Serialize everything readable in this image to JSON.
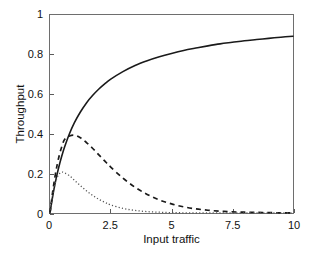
{
  "chart_data": {
    "type": "line",
    "title": "",
    "xlabel": "Input traffic",
    "ylabel": "Throughput",
    "xlim": [
      0,
      10
    ],
    "ylim": [
      0,
      1
    ],
    "grid": false,
    "legend": "none",
    "xticks": [
      "0",
      "2.5",
      "5",
      "7.5",
      "10"
    ],
    "xtick_values": [
      0,
      2.5,
      5,
      7.5,
      10
    ],
    "yticks": [
      "0",
      "0.2",
      "0.4",
      "0.6",
      "0.8",
      "1"
    ],
    "ytick_values": [
      0,
      0.2,
      0.4,
      0.6,
      0.8,
      1
    ],
    "x": [
      0,
      0.1,
      0.2,
      0.3,
      0.4,
      0.5,
      0.6,
      0.8,
      1.0,
      1.25,
      1.5,
      1.75,
      2.0,
      2.25,
      2.5,
      3.0,
      3.5,
      4.0,
      4.5,
      5.0,
      5.5,
      6.0,
      6.5,
      7.0,
      7.5,
      8.0,
      8.5,
      9.0,
      9.5,
      10.0
    ],
    "series": [
      {
        "name": "throughput-solid",
        "style": "solid",
        "color": "#1a1a1a",
        "values": [
          0.0,
          0.077,
          0.143,
          0.2,
          0.25,
          0.294,
          0.333,
          0.4,
          0.455,
          0.51,
          0.556,
          0.593,
          0.625,
          0.652,
          0.676,
          0.714,
          0.745,
          0.769,
          0.789,
          0.806,
          0.821,
          0.833,
          0.844,
          0.854,
          0.862,
          0.87,
          0.876,
          0.882,
          0.888,
          0.893
        ]
      },
      {
        "name": "throughput-dashed",
        "style": "dashed",
        "color": "#1a1a1a",
        "values": [
          0.0,
          0.098,
          0.18,
          0.247,
          0.3,
          0.341,
          0.371,
          0.389,
          0.393,
          0.38,
          0.356,
          0.327,
          0.295,
          0.263,
          0.232,
          0.176,
          0.13,
          0.094,
          0.066,
          0.046,
          0.031,
          0.021,
          0.014,
          0.009,
          0.006,
          0.004,
          0.003,
          0.002,
          0.001,
          0.001
        ]
      },
      {
        "name": "throughput-dotted",
        "style": "dotted",
        "color": "#555555",
        "values": [
          0.0,
          0.085,
          0.144,
          0.181,
          0.2,
          0.206,
          0.203,
          0.188,
          0.166,
          0.138,
          0.112,
          0.089,
          0.07,
          0.054,
          0.041,
          0.023,
          0.013,
          0.007,
          0.004,
          0.002,
          0.001,
          0.0005,
          0.0003,
          0.0002,
          0.0001,
          0.0,
          0.0,
          0.0,
          0.0,
          0.0
        ]
      }
    ],
    "annotations": {
      "dashed_peak": {
        "x": 1.0,
        "y": 0.393
      },
      "dotted_peak": {
        "x": 0.5,
        "y": 0.206
      },
      "solid_endpoint": {
        "x": 10,
        "y": 0.893
      }
    }
  }
}
